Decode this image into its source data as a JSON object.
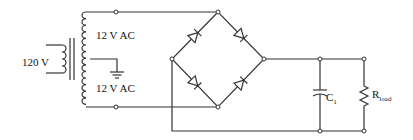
{
  "diagram": {
    "type": "full-wave bridge rectifier with center-tapped transformer",
    "labels": {
      "primary_voltage": "120 V",
      "secondary_upper": "12 V AC",
      "secondary_lower": "12 V AC",
      "capacitor_main": "C",
      "capacitor_sub": "1",
      "resistor_main": "R",
      "resistor_sub": "load"
    },
    "components": [
      {
        "id": "transformer",
        "kind": "center-tapped transformer",
        "primary": "120 V",
        "secondary": [
          "12 V AC",
          "12 V AC"
        ]
      },
      {
        "id": "ground",
        "kind": "ground symbol",
        "connected_to": "center tap"
      },
      {
        "id": "bridge",
        "kind": "diode bridge",
        "diodes": 4
      },
      {
        "id": "C1",
        "kind": "capacitor"
      },
      {
        "id": "Rload",
        "kind": "resistor"
      }
    ],
    "colors": {
      "stroke": "#333333",
      "background": "#ffffff"
    }
  }
}
